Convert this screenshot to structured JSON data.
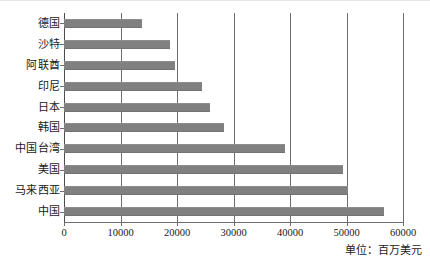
{
  "chart_data": {
    "type": "bar",
    "orientation": "horizontal",
    "title": "",
    "xlabel": "",
    "ylabel": "",
    "unit_note": "单位：百万美元",
    "categories": [
      "德国",
      "沙特",
      "阿联酋",
      "印尼",
      "日本",
      "韩国",
      "中国台湾",
      "美国",
      "马来西亚",
      "中国"
    ],
    "values": [
      13800,
      18800,
      19600,
      24400,
      25800,
      28300,
      39100,
      49400,
      50300,
      56600
    ],
    "xlim": [
      0,
      60000
    ],
    "xticks": [
      0,
      10000,
      20000,
      30000,
      40000,
      50000,
      60000
    ],
    "xtick_labels": [
      "0",
      "10000",
      "20000",
      "30000",
      "40000",
      "50000",
      "60000"
    ],
    "grid": true,
    "grid_axis": "x",
    "legend": false,
    "bar_color": "#808080",
    "axis_color": "#6e6e6e"
  }
}
